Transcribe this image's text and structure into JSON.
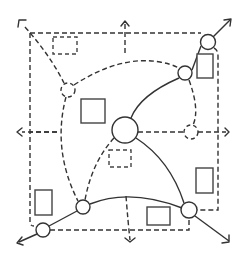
{
  "diagram": {
    "colors": {
      "stroke": "#333333",
      "background": "#ffffff"
    },
    "nodes": [
      {
        "id": "center",
        "x": 125,
        "y": 130,
        "r": 13,
        "style": "solid"
      },
      {
        "id": "top-right",
        "x": 208,
        "y": 42,
        "r": 7.5,
        "style": "solid"
      },
      {
        "id": "upper-right",
        "x": 185,
        "y": 73,
        "r": 7,
        "style": "solid"
      },
      {
        "id": "left-upper",
        "x": 68,
        "y": 90,
        "r": 7,
        "style": "dashed"
      },
      {
        "id": "right-mid",
        "x": 191,
        "y": 132,
        "r": 7,
        "style": "dashed"
      },
      {
        "id": "bottom-right",
        "x": 189,
        "y": 210,
        "r": 8,
        "style": "solid"
      },
      {
        "id": "bottom-mid-left",
        "x": 83,
        "y": 207,
        "r": 7,
        "style": "solid"
      },
      {
        "id": "bottom-left",
        "x": 43,
        "y": 230,
        "r": 7,
        "style": "solid"
      }
    ],
    "rectangles": [
      {
        "id": "rect-top-left",
        "x": 53,
        "y": 37,
        "w": 24,
        "h": 17,
        "style": "dashed"
      },
      {
        "id": "rect-square",
        "x": 81,
        "y": 99,
        "w": 24,
        "h": 24,
        "style": "solid"
      },
      {
        "id": "rect-right-top",
        "x": 197,
        "y": 54,
        "w": 16,
        "h": 24,
        "style": "solid"
      },
      {
        "id": "rect-center-below",
        "x": 109,
        "y": 150,
        "w": 22,
        "h": 17,
        "style": "dashed"
      },
      {
        "id": "rect-right-bottom",
        "x": 196,
        "y": 168,
        "w": 17,
        "h": 25,
        "style": "solid"
      },
      {
        "id": "rect-bottom",
        "x": 147,
        "y": 207,
        "w": 23,
        "h": 18,
        "style": "solid"
      },
      {
        "id": "rect-left-bottom",
        "x": 35,
        "y": 190,
        "w": 17,
        "h": 25,
        "style": "solid"
      }
    ],
    "arrows": [
      {
        "id": "arrow-top-left",
        "direction": "up-left"
      },
      {
        "id": "arrow-top",
        "direction": "up"
      },
      {
        "id": "arrow-top-right",
        "direction": "up-right"
      },
      {
        "id": "arrow-left",
        "direction": "left"
      },
      {
        "id": "arrow-right",
        "direction": "right"
      },
      {
        "id": "arrow-bottom-left",
        "direction": "down-left"
      },
      {
        "id": "arrow-bottom",
        "direction": "down"
      },
      {
        "id": "arrow-bottom-right",
        "direction": "down-right"
      }
    ]
  }
}
